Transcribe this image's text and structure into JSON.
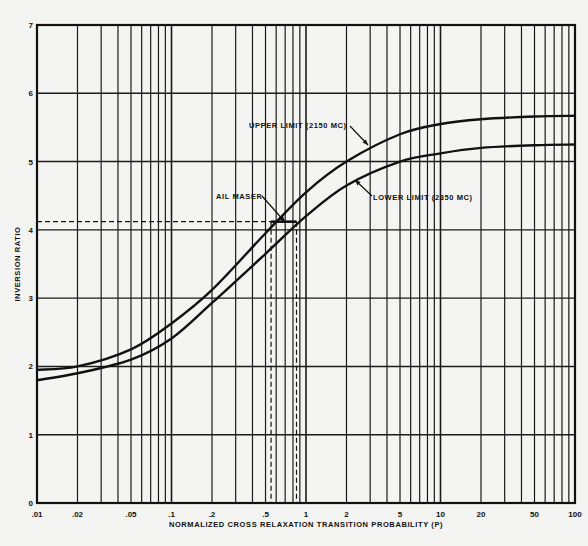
{
  "chart_data": {
    "type": "line",
    "title": "",
    "xlabel": "NORMALIZED CROSS RELAXATION TRANSITION PROBABILITY (P)",
    "ylabel": "INVERSION RATIO",
    "xscale": "log",
    "xlim": [
      0.01,
      100
    ],
    "ylim": [
      0,
      7
    ],
    "grid": true,
    "x_tick_labels": [
      ".01",
      ".02",
      ".05",
      ".1",
      ".2",
      ".5",
      "1",
      "2",
      "5",
      "10",
      "20",
      "50",
      "100"
    ],
    "x_tick_values": [
      0.01,
      0.02,
      0.05,
      0.1,
      0.2,
      0.5,
      1,
      2,
      5,
      10,
      20,
      50,
      100
    ],
    "y_tick_labels": [
      "0",
      "1",
      "2",
      "3",
      "4",
      "5",
      "6",
      "7"
    ],
    "x": [
      0.01,
      0.02,
      0.05,
      0.1,
      0.2,
      0.5,
      1,
      2,
      5,
      10,
      20,
      50,
      100
    ],
    "series": [
      {
        "name": "UPPER LIMIT (2150 MC)",
        "values": [
          1.95,
          2.0,
          2.25,
          2.63,
          3.12,
          3.95,
          4.55,
          5.0,
          5.4,
          5.55,
          5.62,
          5.66,
          5.67
        ]
      },
      {
        "name": "LOWER LIMIT (2350 MC)",
        "values": [
          1.8,
          1.9,
          2.1,
          2.41,
          2.93,
          3.65,
          4.2,
          4.65,
          5.0,
          5.12,
          5.2,
          5.24,
          5.25
        ]
      }
    ],
    "annotations": [
      {
        "text": "UPPER LIMIT (2150 MC)",
        "target_series": 0
      },
      {
        "text": "LOWER LIMIT (2350 MC)",
        "target_series": 1
      },
      {
        "text": "AIL MASER",
        "point_range_x": [
          0.55,
          0.85
        ],
        "y": 4.12
      }
    ],
    "reference_lines": {
      "horizontal_dashed_y": 4.12,
      "vertical_dashed_x": [
        0.55,
        0.85
      ]
    }
  }
}
